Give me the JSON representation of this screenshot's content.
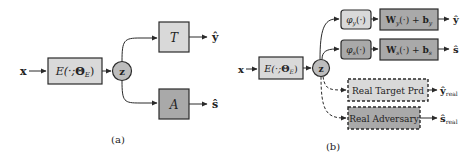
{
  "figure": {
    "panel_a": {
      "caption": "(a)",
      "input_label": "x",
      "encoder_label": "E(·;Θ_E)",
      "encoder_text": {
        "main": "E(·;",
        "theta": "Θ",
        "sub": "E",
        "close": ")"
      },
      "latent_label": "z",
      "target_head": "T",
      "adversary_head": "A",
      "target_output": "ŷ",
      "adversary_output": "ŝ"
    },
    "panel_b": {
      "caption": "(b)",
      "input_label": "x",
      "encoder_text": {
        "main": "E(·;",
        "theta": "Θ",
        "sub": "E",
        "close": ")"
      },
      "latent_label": "z",
      "phi_y": {
        "main": "φ",
        "sub": "y",
        "arg": "(·)"
      },
      "phi_s": {
        "main": "φ",
        "sub": "s",
        "arg": "(·)"
      },
      "linear_y": {
        "w": "W",
        "wsub": "y",
        "mid": "(·) + ",
        "b": "b",
        "bsub": "y"
      },
      "linear_s": {
        "w": "W",
        "wsub": "s",
        "mid": "(·) + ",
        "b": "b",
        "bsub": "s"
      },
      "target_output": "ŷ",
      "adversary_output": "ŝ",
      "real_target_label": "Real Target Prd",
      "real_adversary_label": "Real Adversary",
      "real_target_output": {
        "main": "ŷ",
        "sub": "real"
      },
      "real_adversary_output": {
        "main": "ŝ",
        "sub": "real"
      }
    },
    "colors": {
      "light_box": "#d9d9d9",
      "dark_box": "#a9a9a9",
      "latent_circle": "#bdbdbd",
      "stroke": "#2a2a2a"
    }
  }
}
